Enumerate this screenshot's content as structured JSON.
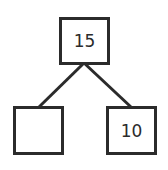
{
  "diagram": {
    "type": "number-bond",
    "colors": {
      "stroke": "#2b2b2b",
      "background": "#ffffff"
    },
    "root": {
      "value": "15"
    },
    "children": [
      {
        "value": ""
      },
      {
        "value": "10"
      }
    ]
  }
}
